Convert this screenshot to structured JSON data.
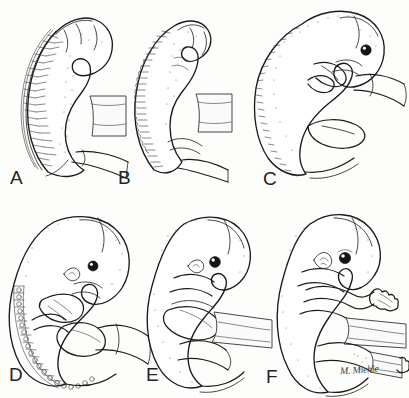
{
  "figure": {
    "background_color": "#fdfdfc",
    "ink_color": "#1a1a1a",
    "width": 409,
    "height": 398,
    "columns": 3,
    "rows": 2
  },
  "panels": [
    {
      "label": "A",
      "name": "panel-a",
      "stage_note": "C-shaped embryo with prominent segmented somite column along dorsal neural tube; small limb buds; yolk stalk and connecting stalk extend caudally."
    },
    {
      "label": "B",
      "name": "panel-b",
      "stage_note": "Embryo with scalloped dorsal margin of closely packed somites; head flexure pronounced; paddle-like limb buds forming."
    },
    {
      "label": "C",
      "name": "panel-c",
      "stage_note": "Curved embryo with visible pigmented eye, developing upper and lower limb buds, and umbilical cord at the ventral surface."
    },
    {
      "label": "D",
      "name": "panel-d",
      "stage_note": "Embryo with distinct head, eye, external ear anlage, paddle-shaped hand and foot plates; somite row still visible along the back."
    },
    {
      "label": "E",
      "name": "panel-e",
      "stage_note": "Embryo with enlarged rounded cranium, clearly pigmented eye, flexed limbs, and thickened umbilical cord."
    },
    {
      "label": "F",
      "name": "panel-f",
      "stage_note": "Most advanced stage: well formed head with eye and auricle, digit rays apparent in the hand, distinct elbow and knee flexion, tapering tail."
    }
  ],
  "signature": {
    "text": "M. Miehle",
    "name": "artist-signature"
  }
}
